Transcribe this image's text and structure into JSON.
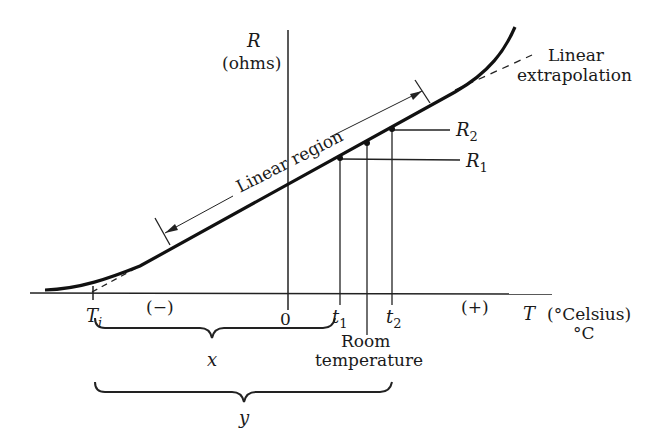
{
  "diagram": {
    "type": "resistance-vs-temperature",
    "axes": {
      "y_label": "R",
      "y_unit": "(ohms)",
      "x_label": "T",
      "x_unit": "(°Celsius)",
      "x_unit_short": "°C",
      "negative_side": "(−)",
      "positive_side": "(+)",
      "origin": "0"
    },
    "annotations": {
      "linear_region": "Linear region",
      "linear_extrapolation_line1": "Linear",
      "linear_extrapolation_line2": "extrapolation",
      "r1": "R",
      "r1_sub": "1",
      "r2": "R",
      "r2_sub": "2",
      "t1": "t",
      "t1_sub": "1",
      "t2": "t",
      "t2_sub": "2",
      "ti": "T",
      "ti_sub": "i",
      "room_temp_line1": "Room",
      "room_temp_line2": "temperature",
      "brace_x": "x",
      "brace_y": "y"
    }
  }
}
